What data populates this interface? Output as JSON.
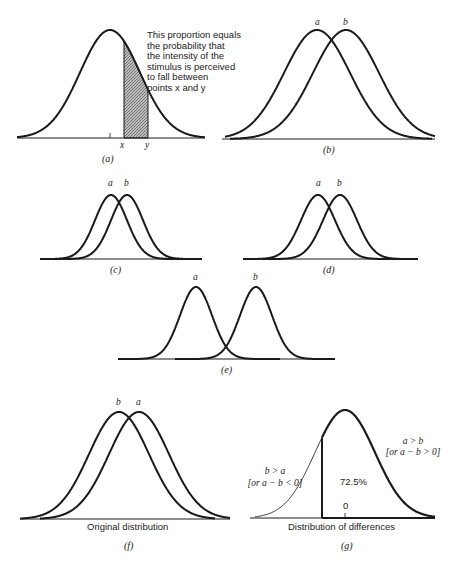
{
  "panels": {
    "a": {
      "caption": "(a)",
      "annotation_lines": [
        "This proportion equals",
        "the probability that",
        "the intensity of the",
        "stimulus is perceived",
        "to fall between",
        "points x and y"
      ],
      "point_x": "x",
      "point_y": "y"
    },
    "b": {
      "caption": "(b)",
      "label_a": "a",
      "label_b": "b"
    },
    "c": {
      "caption": "(c)",
      "label_a": "a",
      "label_b": "b"
    },
    "d": {
      "caption": "(d)",
      "label_a": "a",
      "label_b": "b"
    },
    "e": {
      "caption": "(e)",
      "label_a": "a",
      "label_b": "b"
    },
    "f": {
      "caption": "(f)",
      "label_a": "a",
      "label_b": "b",
      "axis_label": "Original distribution"
    },
    "g": {
      "caption": "(g)",
      "axis_label": "Distribution of differences",
      "zero_label": "0",
      "percent": "72.5%",
      "right_label_1": "a > b",
      "right_label_2": "[or a − b > 0]",
      "left_label_1": "b > a",
      "left_label_2": "[or a − b < 0]"
    }
  },
  "colors": {
    "line": "#1a1a1a",
    "shade": "#9a9a9a"
  }
}
